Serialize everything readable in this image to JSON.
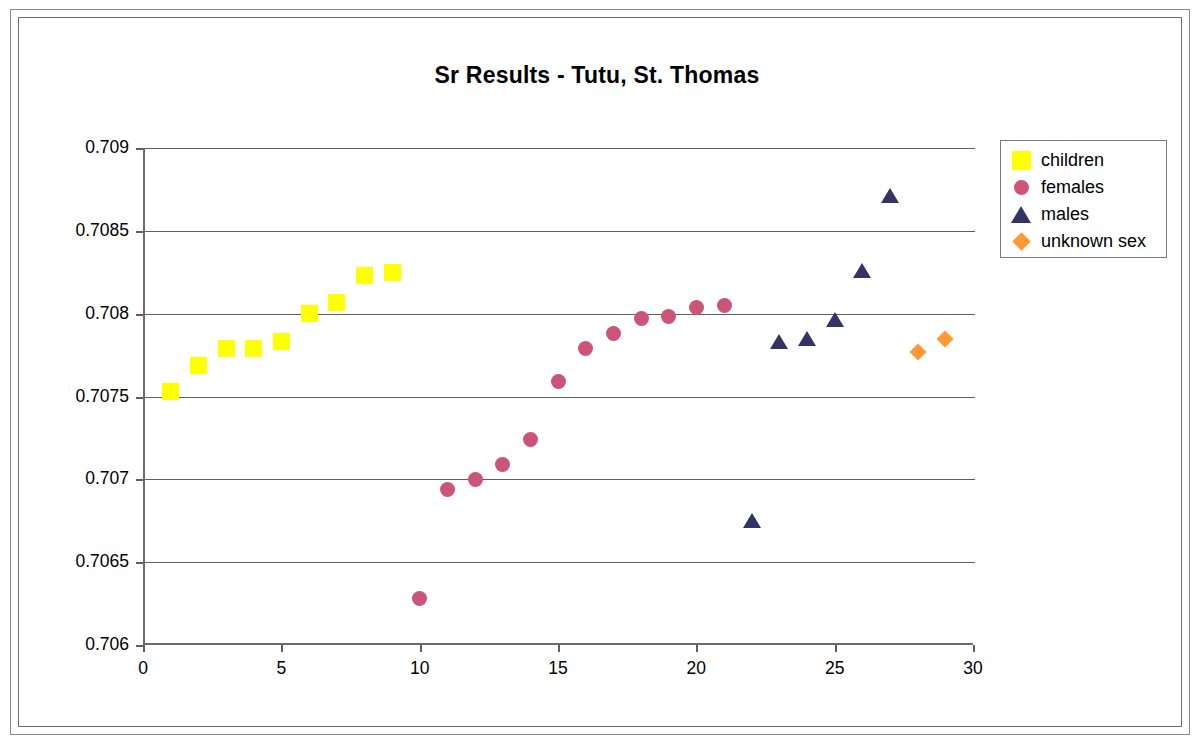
{
  "chart_data": {
    "type": "scatter",
    "title": "Sr Results - Tutu, St. Thomas",
    "xlabel": "",
    "ylabel": "",
    "xlim": [
      0,
      30
    ],
    "ylim": [
      0.706,
      0.709
    ],
    "xticks": [
      "0",
      "5",
      "10",
      "15",
      "20",
      "25",
      "30"
    ],
    "xtick_values": [
      0,
      5,
      10,
      15,
      20,
      25,
      30
    ],
    "yticks": [
      "0.706",
      "0.7065",
      "0.707",
      "0.7075",
      "0.708",
      "0.7085",
      "0.709"
    ],
    "ytick_values": [
      0.706,
      0.7065,
      0.707,
      0.7075,
      0.708,
      0.7085,
      0.709
    ],
    "grid": "horizontal",
    "legend_position": "right",
    "series": [
      {
        "name": "children",
        "marker": "square",
        "color": "#FFFF00",
        "points": [
          {
            "x": 1,
            "y": 0.70753
          },
          {
            "x": 2,
            "y": 0.70769
          },
          {
            "x": 3,
            "y": 0.70779
          },
          {
            "x": 4,
            "y": 0.70779
          },
          {
            "x": 5,
            "y": 0.70783
          },
          {
            "x": 6,
            "y": 0.708
          },
          {
            "x": 7,
            "y": 0.70807
          },
          {
            "x": 8,
            "y": 0.70823
          },
          {
            "x": 9,
            "y": 0.70825
          }
        ]
      },
      {
        "name": "females",
        "marker": "circle",
        "color": "#CC5577",
        "points": [
          {
            "x": 10,
            "y": 0.70628
          },
          {
            "x": 11,
            "y": 0.70694
          },
          {
            "x": 12,
            "y": 0.707
          },
          {
            "x": 13,
            "y": 0.70709
          },
          {
            "x": 14,
            "y": 0.70724
          },
          {
            "x": 15,
            "y": 0.70759
          },
          {
            "x": 16,
            "y": 0.70779
          },
          {
            "x": 17,
            "y": 0.70788
          },
          {
            "x": 18,
            "y": 0.70797
          },
          {
            "x": 19,
            "y": 0.70798
          },
          {
            "x": 20,
            "y": 0.70804
          },
          {
            "x": 21,
            "y": 0.70805
          }
        ]
      },
      {
        "name": "males",
        "marker": "triangle",
        "color": "#333366",
        "points": [
          {
            "x": 22,
            "y": 0.70675
          },
          {
            "x": 23,
            "y": 0.70783
          },
          {
            "x": 24,
            "y": 0.70785
          },
          {
            "x": 25,
            "y": 0.70796
          },
          {
            "x": 26,
            "y": 0.70826
          },
          {
            "x": 27,
            "y": 0.70871
          }
        ]
      },
      {
        "name": "unknown sex",
        "marker": "diamond",
        "color": "#FF9933",
        "points": [
          {
            "x": 28,
            "y": 0.70777
          },
          {
            "x": 29,
            "y": 0.70785
          }
        ]
      }
    ]
  },
  "legend": {
    "items": [
      {
        "label": "children",
        "marker": "square",
        "color": "#FFFF00"
      },
      {
        "label": "females",
        "marker": "circle",
        "color": "#CC5577"
      },
      {
        "label": "males",
        "marker": "triangle",
        "color": "#333366"
      },
      {
        "label": "unknown sex",
        "marker": "diamond",
        "color": "#FF9933"
      }
    ]
  }
}
